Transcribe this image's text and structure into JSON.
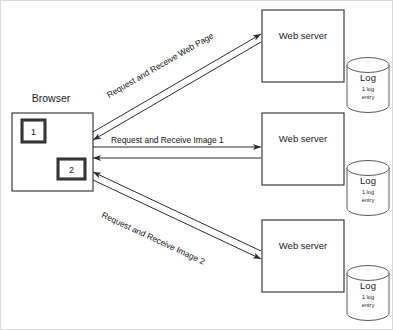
{
  "diagram": {
    "type": "sequence-flow-diagram",
    "background_color": "#ffffff",
    "line_color": "#2b2b2b",
    "browser": {
      "caption": "Browser",
      "items": [
        {
          "label": "1"
        },
        {
          "label": "2"
        }
      ]
    },
    "servers": [
      {
        "label": "Web server",
        "log": {
          "title": "Log",
          "detail_line1": "1 log",
          "detail_line2": "entry"
        }
      },
      {
        "label": "Web server",
        "log": {
          "title": "Log",
          "detail_line1": "1 log",
          "detail_line2": "entry"
        }
      },
      {
        "label": "Web server",
        "log": {
          "title": "Log",
          "detail_line1": "1 log",
          "detail_line2": "entry"
        }
      }
    ],
    "connections": [
      {
        "label": "Request and Receive Web Page",
        "direction": "bidirectional"
      },
      {
        "label": "Request and Receive Image 1",
        "direction": "bidirectional"
      },
      {
        "label": "Request and Receive Image 2",
        "direction": "bidirectional"
      }
    ]
  }
}
